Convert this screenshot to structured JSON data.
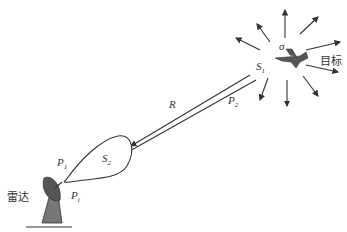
{
  "diagram": {
    "title": "",
    "labels": {
      "sigma": "σ",
      "s1_main": "S",
      "s1_sub": "1",
      "s2_main": "S",
      "s2_sub": "2",
      "range": "R",
      "p2_main": "P",
      "p2_sub": "2",
      "p1_main": "P",
      "p1_sub": "1",
      "pt_main": "P",
      "pt_sub": "t",
      "target": "目标",
      "radar": "雷达"
    },
    "elements": [
      "radar antenna",
      "transmit beam lobe",
      "incident/return path",
      "target aircraft",
      "scattered rays"
    ],
    "colors": {
      "line": "#333333",
      "radar_fill": "#555555",
      "background": "#ffffff"
    }
  }
}
